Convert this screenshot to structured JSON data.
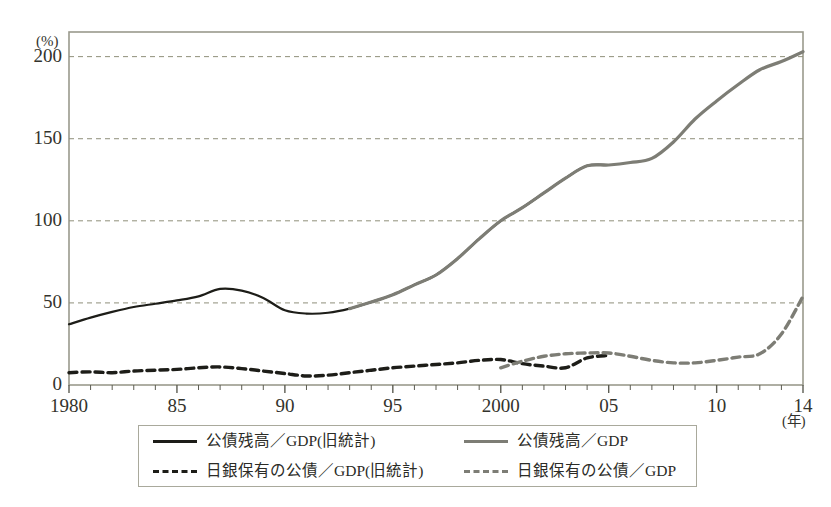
{
  "chart_data": {
    "type": "line",
    "title": "",
    "xlabel": "(年)",
    "ylabel": "(%)",
    "xlim": [
      1980,
      2014
    ],
    "ylim": [
      0,
      215
    ],
    "grid": true,
    "grid_values": [
      50,
      100,
      150,
      200
    ],
    "legend_position": "below-plot",
    "x": [
      1980,
      1981,
      1982,
      1983,
      1984,
      1985,
      1986,
      1987,
      1988,
      1989,
      1990,
      1991,
      1992,
      1993,
      1994,
      1995,
      1996,
      1997,
      1998,
      1999,
      2000,
      2001,
      2002,
      2003,
      2004,
      2005,
      2006,
      2007,
      2008,
      2009,
      2010,
      2011,
      2012,
      2013,
      2014
    ],
    "xtick_positions": [
      1980,
      1985,
      1990,
      1995,
      2000,
      2005,
      2010,
      2014
    ],
    "xtick_labels": [
      "1980",
      "85",
      "90",
      "95",
      "2000",
      "05",
      "10",
      "14"
    ],
    "ytick_values": [
      0,
      50,
      100,
      150,
      200
    ],
    "ytick_labels": [
      "0",
      "50",
      "100",
      "150",
      "200"
    ],
    "series": [
      {
        "name": "公債残高／GDP（旧統計）",
        "style": "solid",
        "color": "#1d1d18",
        "x": [
          1980,
          1981,
          1982,
          1983,
          1984,
          1985,
          1986,
          1987,
          1988,
          1989,
          1990,
          1991,
          1992,
          1993,
          1994,
          1995,
          1996,
          1997,
          1998,
          1999,
          2000,
          2001,
          2002,
          2003,
          2004,
          2005
        ],
        "values": [
          37,
          41,
          44.5,
          47.5,
          49.5,
          51.5,
          54,
          58.5,
          57.5,
          53,
          45.5,
          43.5,
          44,
          46.5,
          50.5,
          55,
          61,
          67,
          77,
          89,
          100,
          108,
          117,
          126,
          133.5,
          134
        ]
      },
      {
        "name": "公債残高／GDP",
        "style": "solid",
        "color": "#7d7d75",
        "x": [
          1993,
          1994,
          1995,
          1996,
          1997,
          1998,
          1999,
          2000,
          2001,
          2002,
          2003,
          2004,
          2005,
          2006,
          2007,
          2008,
          2009,
          2010,
          2011,
          2012,
          2013,
          2014
        ],
        "values": [
          46.5,
          50.5,
          55,
          61,
          67,
          77,
          89,
          100,
          108,
          117,
          126,
          133.5,
          134,
          135.5,
          138,
          148,
          162,
          173,
          183,
          192,
          197,
          203
        ]
      },
      {
        "name": "日銀保有の公債／GDP（旧統計）",
        "style": "dashed",
        "color": "#1d1d18",
        "x": [
          1980,
          1981,
          1982,
          1983,
          1984,
          1985,
          1986,
          1987,
          1988,
          1989,
          1990,
          1991,
          1992,
          1993,
          1994,
          1995,
          1996,
          1997,
          1998,
          1999,
          2000,
          2001,
          2002,
          2003,
          2004,
          2005
        ],
        "values": [
          7.5,
          8,
          7.5,
          8.5,
          9,
          9.5,
          10.5,
          11,
          10,
          8.5,
          7,
          5.5,
          6,
          7.5,
          9,
          10.5,
          11.5,
          12.5,
          13.5,
          15,
          15.5,
          13,
          11.5,
          10.5,
          16.5,
          18
        ]
      },
      {
        "name": "日銀保有の公債／GDP",
        "style": "dashed",
        "color": "#7d7d75",
        "x": [
          2000,
          2001,
          2002,
          2003,
          2004,
          2005,
          2006,
          2007,
          2008,
          2009,
          2010,
          2011,
          2012,
          2013,
          2014
        ],
        "values": [
          10.5,
          14.5,
          17.5,
          19,
          19.5,
          19.5,
          17.5,
          15,
          13.5,
          13.5,
          15,
          17,
          19,
          31,
          54
        ]
      }
    ]
  },
  "axes": {
    "y_unit": "(%)",
    "x_unit": "(年)"
  },
  "legend": {
    "items": [
      {
        "label": "公債残高／GDP(旧統計)",
        "style": "solid-dark"
      },
      {
        "label": "公債残高／GDP",
        "style": "solid-gray"
      },
      {
        "label": "日銀保有の公債／GDP(旧統計)",
        "style": "dashed-dark"
      },
      {
        "label": "日銀保有の公債／GDP",
        "style": "dashed-gray"
      }
    ]
  }
}
